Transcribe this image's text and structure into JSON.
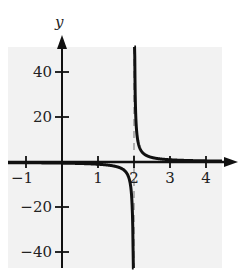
{
  "chart_data": {
    "type": "line",
    "title": "",
    "function": "y = 1/(x - 2)",
    "xlabel": "x",
    "ylabel": "y",
    "xlim": [
      -1.5,
      4.5
    ],
    "ylim": [
      -50,
      55
    ],
    "x_ticks": [
      -1,
      1,
      2,
      3,
      4
    ],
    "x_tick_labels": [
      "−1",
      "1",
      "2",
      "3",
      "4"
    ],
    "y_ticks": [
      40,
      20,
      -20,
      -40
    ],
    "y_tick_labels": [
      "40",
      "20",
      "−20",
      "−40"
    ],
    "vertical_asymptote": 2,
    "horizontal_asymptote": 0,
    "grid": false,
    "legend": null,
    "background_panel_color": "#f2f2f2",
    "curve_color": "#111111",
    "asymptote_color": "#999999",
    "series": [
      {
        "name": "left branch",
        "x": [
          -1.5,
          -1,
          0,
          1,
          1.5,
          1.8,
          1.9,
          1.95,
          1.98
        ],
        "values": [
          -0.29,
          -0.33,
          -0.5,
          -1,
          -2,
          -5,
          -10,
          -20,
          -50
        ]
      },
      {
        "name": "right branch",
        "x": [
          2.02,
          2.05,
          2.1,
          2.2,
          2.5,
          3,
          4,
          4.5
        ],
        "values": [
          50,
          20,
          10,
          5,
          2,
          1,
          0.5,
          0.4
        ]
      }
    ]
  }
}
